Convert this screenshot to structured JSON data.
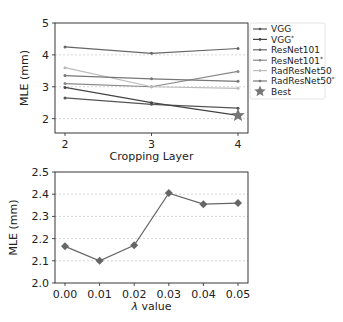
{
  "chart_data": [
    {
      "type": "line",
      "title": "",
      "xlabel": "Cropping Layer",
      "ylabel": "MLE (mm)",
      "x": [
        2,
        3,
        4
      ],
      "xticks": [
        "2",
        "3",
        "4"
      ],
      "yticks": [
        "2",
        "3",
        "4",
        "5"
      ],
      "ylim": [
        1.55,
        5
      ],
      "grid": "y-dashed",
      "legend_position": "right-outside",
      "series": [
        {
          "name": "VGG",
          "values": [
            2.65,
            2.45,
            2.33
          ],
          "color": "#555555"
        },
        {
          "name": "VGG*",
          "values": [
            2.98,
            2.5,
            2.1
          ],
          "color": "#444444"
        },
        {
          "name": "ResNet101",
          "values": [
            4.25,
            4.05,
            4.2
          ],
          "color": "#666666"
        },
        {
          "name": "ResNet101*",
          "values": [
            3.1,
            3.0,
            3.48
          ],
          "color": "#888888"
        },
        {
          "name": "RadResNet50",
          "values": [
            3.6,
            3.0,
            2.95
          ],
          "color": "#bbbbbb"
        },
        {
          "name": "RadResNet50*",
          "values": [
            3.35,
            3.25,
            3.17
          ],
          "color": "#777777"
        }
      ],
      "annotations": [
        {
          "label": "Best",
          "marker": "star",
          "x": 4,
          "y": 2.1,
          "color": "#777777"
        }
      ],
      "legend": [
        "VGG",
        "VGG*",
        "ResNet101",
        "ResNet101*",
        "RadResNet50",
        "RadResNet50*",
        "Best"
      ]
    },
    {
      "type": "line",
      "title": "",
      "xlabel": "λ value",
      "ylabel": "MLE (mm)",
      "categories": [
        "0.00",
        "0.01",
        "0.02",
        "0.03",
        "0.04",
        "0.05"
      ],
      "x": [
        0.0,
        0.01,
        0.02,
        0.03,
        0.04,
        0.05
      ],
      "values": [
        2.165,
        2.1,
        2.17,
        2.405,
        2.355,
        2.36
      ],
      "yticks": [
        "2.0",
        "2.1",
        "2.2",
        "2.3",
        "2.4",
        "2.5"
      ],
      "ylim": [
        2.0,
        2.5
      ],
      "marker": "diamond",
      "grid": "y-dashed",
      "color": "#666666"
    }
  ]
}
